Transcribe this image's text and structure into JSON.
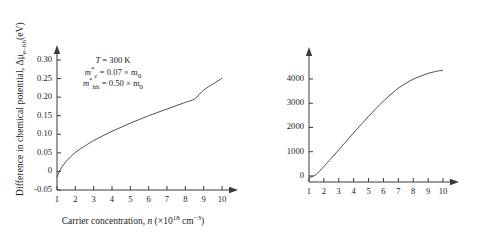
{
  "figure": {
    "background": "#ffffff",
    "line_color": "#3a3a3a",
    "axis_color": "#3a3a3a"
  },
  "panels": [
    {
      "id": "left",
      "annotation": {
        "temperature": "T = 300 K",
        "electron_mass": "m*c = 0.07 × m0",
        "hole_mass": "m*hh = 0.50 × m0"
      },
      "chart_data": {
        "type": "line",
        "title": "",
        "xlabel": "Carrier concentration, n (×10^18 cm^-3)",
        "ylabel": "Difference in chemical potential, Δμ e-hh (eV)",
        "xlim": [
          1,
          10
        ],
        "ylim": [
          -0.05,
          0.3
        ],
        "xticks": [
          1,
          2,
          3,
          4,
          5,
          6,
          7,
          8,
          9,
          10
        ],
        "yticks": [
          -0.05,
          0,
          0.05,
          0.1,
          0.15,
          0.2,
          0.25,
          0.3
        ],
        "ytick_labels": [
          "-0.05",
          "0",
          "0.05",
          "0.10",
          "0.15",
          "0.20",
          "0.25",
          "0.30"
        ],
        "grid": false,
        "legend": false,
        "x": [
          1.0,
          1.15,
          1.3,
          1.5,
          1.75,
          2.0,
          2.25,
          2.5,
          3.0,
          3.5,
          4.0,
          4.5,
          5.0,
          5.5,
          6.0,
          6.5,
          7.0,
          7.5,
          8.0,
          8.5,
          9.0,
          9.5,
          10.0
        ],
        "values": [
          -0.015,
          0.002,
          0.014,
          0.027,
          0.04,
          0.051,
          0.06,
          0.068,
          0.083,
          0.096,
          0.108,
          0.119,
          0.13,
          0.14,
          0.15,
          0.159,
          0.168,
          0.177,
          0.186,
          0.195,
          0.219,
          0.235,
          0.251
        ]
      }
    },
    {
      "id": "right",
      "annotation": {
        "temperature": "T = 300 K",
        "electron_mass": "m*c = 0.07 × m0",
        "hole_mass": "m*hh = 0.50 × m0"
      },
      "chart_data": {
        "type": "line",
        "title": "",
        "xlabel": "Carrier concentration, n (×10^18 cm^-3)",
        "ylabel": "Peak optical gain, g peak(ħω) (cm^-1)",
        "xlim": [
          1,
          10
        ],
        "ylim": [
          -250,
          4700
        ],
        "xticks": [
          1,
          2,
          3,
          4,
          5,
          6,
          7,
          8,
          9,
          10
        ],
        "yticks": [
          0,
          1000,
          2000,
          3000,
          4000
        ],
        "ytick_labels": [
          "0",
          "1000",
          "2000",
          "3000",
          "4000"
        ],
        "grid": false,
        "legend": false,
        "x": [
          1.0,
          1.2,
          1.4,
          1.6,
          1.8,
          2.0,
          2.5,
          3.0,
          3.5,
          4.0,
          4.5,
          5.0,
          5.5,
          6.0,
          6.5,
          7.0,
          7.5,
          8.0,
          8.5,
          9.0,
          9.5,
          10.0
        ],
        "values": [
          -60,
          -30,
          30,
          130,
          250,
          390,
          730,
          1080,
          1430,
          1780,
          2120,
          2460,
          2780,
          3090,
          3370,
          3620,
          3820,
          3990,
          4120,
          4230,
          4310,
          4360
        ]
      }
    }
  ],
  "labels": {
    "xtitle_prefix": "Carrier concentration, ",
    "xtitle_var": "n",
    "xtitle_unit_open": " (×10",
    "xtitle_unit_exp": "18",
    "xtitle_unit_cm": " cm",
    "xtitle_unit_cmexp": "−3",
    "xtitle_unit_close": ")",
    "ytitle_left_a": "Difference in chemical potential, Δμ",
    "ytitle_left_sub": "e–hh",
    "ytitle_left_b": "(eV)",
    "ytitle_right_a": "Peak optical gain, ",
    "ytitle_right_g": "g",
    "ytitle_right_sub": "peak",
    "ytitle_right_b": "(ħω) ( cm",
    "ytitle_right_exp": "−1",
    "ytitle_right_close": ")",
    "annot_T": "T",
    "annot_T_val": " = 300 K",
    "annot_mc": "m",
    "annot_mc_star": "*",
    "annot_mc_sub": "c",
    "annot_mc_val": " = 0.07 × m",
    "annot_m0_sub": "0",
    "annot_mhh": "m",
    "annot_mhh_star": "*",
    "annot_mhh_sub": "hh",
    "annot_mhh_val": " = 0.50 × m"
  }
}
